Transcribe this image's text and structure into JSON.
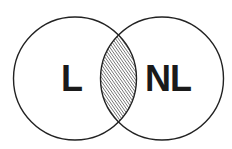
{
  "diagram": {
    "type": "venn",
    "sets": [
      {
        "id": "left",
        "label": "L"
      },
      {
        "id": "right",
        "label": "NL"
      }
    ],
    "intersection": {
      "fill": "hatched",
      "hatch_direction": "diagonal-up"
    },
    "colors": {
      "stroke": "#222222",
      "hatch": "#333333",
      "background": "#ffffff",
      "text": "#1a1a1a"
    }
  }
}
